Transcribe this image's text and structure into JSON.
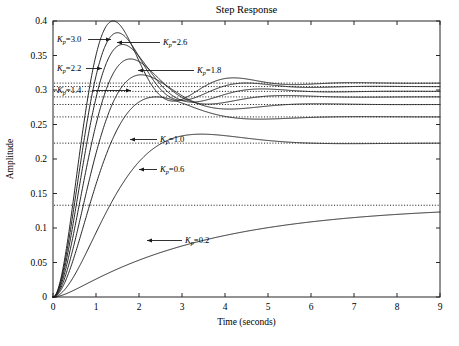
{
  "chart_data": {
    "type": "line",
    "title": "Step Response",
    "xlabel": "Time (seconds)",
    "ylabel": "Amplitude",
    "xlim": [
      0,
      9
    ],
    "ylim": [
      0,
      0.4
    ],
    "xticks": [
      "0",
      "1",
      "2",
      "3",
      "4",
      "5",
      "6",
      "7",
      "8",
      "9"
    ],
    "yticks": [
      "0",
      "0.05",
      "0.1",
      "0.15",
      "0.2",
      "0.25",
      "0.3",
      "0.35",
      "0.4"
    ],
    "grid": false,
    "legend": "inline annotations with arrow leaders",
    "line_color": "#1a1a1a",
    "reference_line_style": "dotted horizontal steady-state lines",
    "series": [
      {
        "name": "Kp=3.0",
        "gain": 3.0,
        "steady_state": 0.31,
        "peak": 0.4,
        "peak_time": 1.4,
        "damping": "oscillatory, largest overshoot"
      },
      {
        "name": "Kp=2.6",
        "gain": 2.6,
        "steady_state": 0.305,
        "peak": 0.383,
        "peak_time": 1.5,
        "damping": "oscillatory"
      },
      {
        "name": "Kp=2.2",
        "gain": 2.2,
        "steady_state": 0.298,
        "peak": 0.366,
        "peak_time": 1.62,
        "damping": "oscillatory"
      },
      {
        "name": "Kp=1.8",
        "gain": 1.8,
        "steady_state": 0.29,
        "peak": 0.345,
        "peak_time": 1.8,
        "damping": "moderate overshoot"
      },
      {
        "name": "Kp=1.4",
        "gain": 1.4,
        "steady_state": 0.279,
        "peak": 0.322,
        "peak_time": 2.05,
        "damping": "moderate overshoot"
      },
      {
        "name": "Kp=1.0",
        "gain": 1.0,
        "steady_state": 0.261,
        "peak": 0.29,
        "peak_time": 2.4,
        "damping": "small overshoot"
      },
      {
        "name": "Kp=0.6",
        "gain": 0.6,
        "steady_state": 0.223,
        "peak": 0.236,
        "peak_time": 3.45,
        "damping": "slight overshoot"
      },
      {
        "name": "Kp=0.2",
        "gain": 0.2,
        "steady_state": 0.133,
        "peak": 0.133,
        "peak_time": 9.0,
        "damping": "overdamped, no overshoot"
      }
    ],
    "annotations": [
      {
        "label": "Kp=3.0",
        "base": "K",
        "sub": "p",
        "value": "=3.0"
      },
      {
        "label": "Kp=2.6",
        "base": "K",
        "sub": "p",
        "value": "=2.6"
      },
      {
        "label": "Kp=2.2",
        "base": "K",
        "sub": "p",
        "value": "=2.2"
      },
      {
        "label": "Kp=1.8",
        "base": "K",
        "sub": "p",
        "value": "=1.8"
      },
      {
        "label": "Kp=1.4",
        "base": "K",
        "sub": "p",
        "value": "=1.4"
      },
      {
        "label": "Kp=1.0",
        "base": "K",
        "sub": "p",
        "value": "=1.0"
      },
      {
        "label": "Kp=0.6",
        "base": "K",
        "sub": "p",
        "value": "=0.6"
      },
      {
        "label": "Kp=0.2",
        "base": "K",
        "sub": "p",
        "value": "=0.2"
      }
    ]
  }
}
